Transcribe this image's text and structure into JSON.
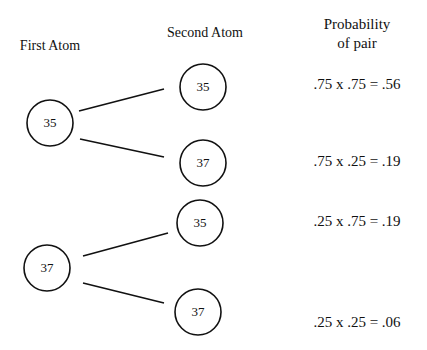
{
  "headers": {
    "first_atom": "First Atom",
    "second_atom": "Second Atom",
    "probability_line1": "Probability",
    "probability_line2": "of pair"
  },
  "tree": {
    "first_atoms": [
      {
        "label": "35",
        "second_atoms": [
          {
            "label": "35",
            "probability": ".75 x .75 = .56"
          },
          {
            "label": "37",
            "probability": ".75 x .25 = .19"
          }
        ]
      },
      {
        "label": "37",
        "second_atoms": [
          {
            "label": "35",
            "probability": ".25 x .75 = .19"
          },
          {
            "label": "37",
            "probability": ".25 x .25 = .06"
          }
        ]
      }
    ]
  },
  "colors": {
    "stroke": "#111111",
    "background": "#ffffff"
  }
}
